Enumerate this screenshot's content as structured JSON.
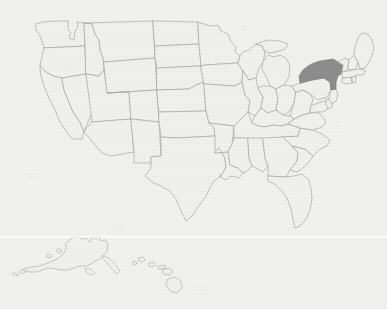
{
  "map": {
    "title": "United States Map",
    "description": "Outline map of the United States with state borders, including Alaska and Hawaii insets. New York is shaded.",
    "projection": "albers-usa",
    "background_color": "#f1f1f0",
    "border_color": "#a8a8a6",
    "state_fill_color": "#f0f0ef",
    "highlight_fill_color": "#8d8d8d",
    "highlighted_states": [
      "New York"
    ],
    "insets": [
      {
        "name": "Alaska",
        "abbr": "AK",
        "position": "bottom-left"
      },
      {
        "name": "Hawaii",
        "abbr": "HI",
        "position": "bottom-center"
      }
    ],
    "states": [
      {
        "abbr": "WA",
        "name": "Washington",
        "highlighted": false
      },
      {
        "abbr": "OR",
        "name": "Oregon",
        "highlighted": false
      },
      {
        "abbr": "CA",
        "name": "California",
        "highlighted": false
      },
      {
        "abbr": "NV",
        "name": "Nevada",
        "highlighted": false
      },
      {
        "abbr": "ID",
        "name": "Idaho",
        "highlighted": false
      },
      {
        "abbr": "MT",
        "name": "Montana",
        "highlighted": false
      },
      {
        "abbr": "WY",
        "name": "Wyoming",
        "highlighted": false
      },
      {
        "abbr": "UT",
        "name": "Utah",
        "highlighted": false
      },
      {
        "abbr": "AZ",
        "name": "Arizona",
        "highlighted": false
      },
      {
        "abbr": "CO",
        "name": "Colorado",
        "highlighted": false
      },
      {
        "abbr": "NM",
        "name": "New Mexico",
        "highlighted": false
      },
      {
        "abbr": "ND",
        "name": "North Dakota",
        "highlighted": false
      },
      {
        "abbr": "SD",
        "name": "South Dakota",
        "highlighted": false
      },
      {
        "abbr": "NE",
        "name": "Nebraska",
        "highlighted": false
      },
      {
        "abbr": "KS",
        "name": "Kansas",
        "highlighted": false
      },
      {
        "abbr": "OK",
        "name": "Oklahoma",
        "highlighted": false
      },
      {
        "abbr": "TX",
        "name": "Texas",
        "highlighted": false
      },
      {
        "abbr": "MN",
        "name": "Minnesota",
        "highlighted": false
      },
      {
        "abbr": "IA",
        "name": "Iowa",
        "highlighted": false
      },
      {
        "abbr": "MO",
        "name": "Missouri",
        "highlighted": false
      },
      {
        "abbr": "AR",
        "name": "Arkansas",
        "highlighted": false
      },
      {
        "abbr": "LA",
        "name": "Louisiana",
        "highlighted": false
      },
      {
        "abbr": "WI",
        "name": "Wisconsin",
        "highlighted": false
      },
      {
        "abbr": "IL",
        "name": "Illinois",
        "highlighted": false
      },
      {
        "abbr": "MI",
        "name": "Michigan",
        "highlighted": false
      },
      {
        "abbr": "IN",
        "name": "Indiana",
        "highlighted": false
      },
      {
        "abbr": "OH",
        "name": "Ohio",
        "highlighted": false
      },
      {
        "abbr": "KY",
        "name": "Kentucky",
        "highlighted": false
      },
      {
        "abbr": "TN",
        "name": "Tennessee",
        "highlighted": false
      },
      {
        "abbr": "MS",
        "name": "Mississippi",
        "highlighted": false
      },
      {
        "abbr": "AL",
        "name": "Alabama",
        "highlighted": false
      },
      {
        "abbr": "GA",
        "name": "Georgia",
        "highlighted": false
      },
      {
        "abbr": "FL",
        "name": "Florida",
        "highlighted": false
      },
      {
        "abbr": "SC",
        "name": "South Carolina",
        "highlighted": false
      },
      {
        "abbr": "NC",
        "name": "North Carolina",
        "highlighted": false
      },
      {
        "abbr": "VA",
        "name": "Virginia",
        "highlighted": false
      },
      {
        "abbr": "WV",
        "name": "West Virginia",
        "highlighted": false
      },
      {
        "abbr": "MD",
        "name": "Maryland",
        "highlighted": false
      },
      {
        "abbr": "DE",
        "name": "Delaware",
        "highlighted": false
      },
      {
        "abbr": "PA",
        "name": "Pennsylvania",
        "highlighted": false
      },
      {
        "abbr": "NJ",
        "name": "New Jersey",
        "highlighted": false
      },
      {
        "abbr": "NY",
        "name": "New York",
        "highlighted": true
      },
      {
        "abbr": "CT",
        "name": "Connecticut",
        "highlighted": false
      },
      {
        "abbr": "RI",
        "name": "Rhode Island",
        "highlighted": false
      },
      {
        "abbr": "MA",
        "name": "Massachusetts",
        "highlighted": false
      },
      {
        "abbr": "VT",
        "name": "Vermont",
        "highlighted": false
      },
      {
        "abbr": "NH",
        "name": "New Hampshire",
        "highlighted": false
      },
      {
        "abbr": "ME",
        "name": "Maine",
        "highlighted": false
      },
      {
        "abbr": "AK",
        "name": "Alaska",
        "highlighted": false
      },
      {
        "abbr": "HI",
        "name": "Hawaii",
        "highlighted": false
      }
    ]
  }
}
